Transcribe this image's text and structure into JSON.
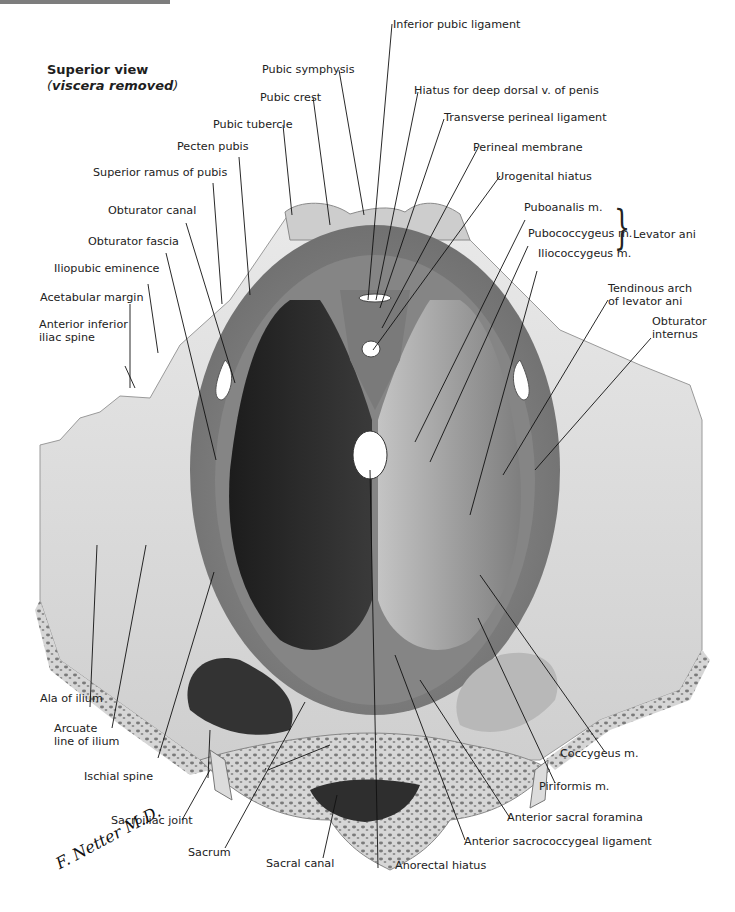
{
  "header": {
    "cross_reference": "See also Plate 382"
  },
  "view": {
    "title": "Superior view",
    "subtitle_open": "(",
    "subtitle": "viscera removed",
    "subtitle_close": ")"
  },
  "signature": "F. Netter M.D.",
  "group_label": {
    "text": "Levator ani",
    "members": [
      "Puboanalis m.",
      "Pubococcygeus m.",
      "Iliococcygeus m."
    ]
  },
  "labels": {
    "inferior_pubic_ligament": "Inferior pubic ligament",
    "pubic_symphysis": "Pubic symphysis",
    "hiatus_deep_dorsal": "Hiatus for deep dorsal v. of penis",
    "pubic_crest": "Pubic crest",
    "transverse_perineal": "Transverse perineal ligament",
    "pubic_tubercle": "Pubic tubercle",
    "perineal_membrane": "Perineal membrane",
    "pecten_pubis": "Pecten pubis",
    "urogenital_hiatus": "Urogenital hiatus",
    "superior_ramus": "Superior ramus of  pubis",
    "puboanalis": "Puboanalis m.",
    "obturator_canal": "Obturator canal",
    "pubococcygeus": "Pubococcygeus m.",
    "levator_ani": "Levator ani",
    "obturator_fascia": "Obturator fascia",
    "iliococcygeus": "Iliococcygeus m.",
    "iliopubic_eminence": "Iliopubic eminence",
    "tendinous_arch_1": "Tendinous arch",
    "tendinous_arch_2": "of levator ani",
    "acetabular_margin": "Acetabular margin",
    "obturator_internus_1": "Obturator",
    "obturator_internus_2": "internus",
    "aiis_1": "Anterior inferior",
    "aiis_2": "iliac spine",
    "ala_of_ilium": "Ala of ilium",
    "arcuate_1": "Arcuate",
    "arcuate_2": "line of ilium",
    "coccygeus": "Coccygeus m.",
    "ischial_spine": "Ischial spine",
    "piriformis": "Piriformis m.",
    "sacroiliac_joint": "Sacroiliac joint",
    "anterior_sacral_foramina": "Anterior sacral foramina",
    "sacrum": "Sacrum",
    "anterior_sacrococcygeal": "Anterior sacrococcygeal ligament",
    "sacral_canal": "Sacral canal",
    "anorectal_hiatus": "Anorectal hiatus"
  },
  "colors": {
    "bone_light": "#e2e2e2",
    "bone_mid": "#bdbdbd",
    "muscle_dark": "#2a2a2a",
    "muscle_light": "#a8a8a8",
    "leader": "#111111",
    "header_bar": "#7d7d7d"
  }
}
